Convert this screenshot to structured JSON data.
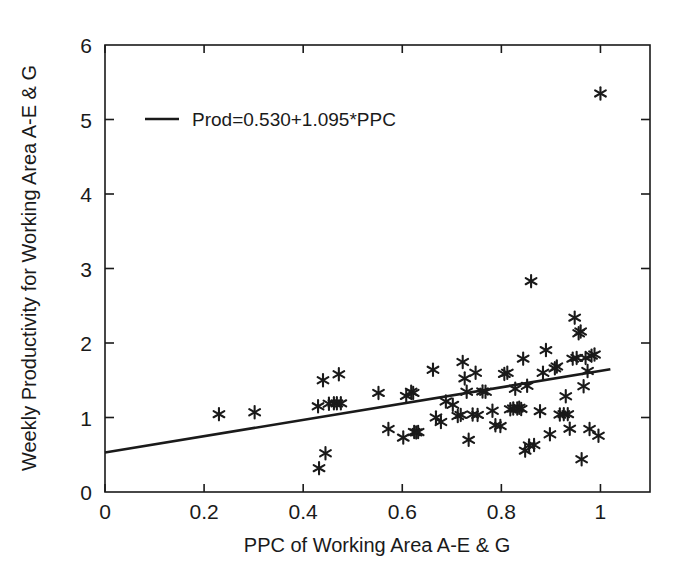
{
  "chart_data": {
    "type": "scatter",
    "title": "",
    "xlabel": "PPC of  Working Area A-E & G",
    "ylabel": "Weekly Productivity for Working Area A-E & G",
    "xlim": [
      0,
      1.1
    ],
    "ylim": [
      0,
      6
    ],
    "xticks": [
      0,
      0.2,
      0.4,
      0.6,
      0.8,
      1
    ],
    "xticklabels": [
      "0",
      "0.2",
      "0.4",
      "0.6",
      "0.8",
      "1"
    ],
    "yticks": [
      0,
      1,
      2,
      3,
      4,
      5,
      6
    ],
    "yticklabels": [
      "0",
      "1",
      "2",
      "3",
      "4",
      "5",
      "6"
    ],
    "grid": false,
    "marker": "asterisk-star",
    "marker_color": "#1a1a1a",
    "legend": {
      "position": "upper-left-inside",
      "entries": [
        {
          "label": "Prod=0.530+1.095*PPC",
          "style": "line"
        }
      ]
    },
    "fit": {
      "label": "Prod=0.530+1.095*PPC",
      "intercept": 0.53,
      "slope": 1.095,
      "x_start": 0.0,
      "x_end": 1.02,
      "y_start": 0.53,
      "y_end": 1.647
    },
    "series": [
      {
        "name": "Observations",
        "points": [
          [
            0.23,
            1.045
          ],
          [
            0.302,
            1.07
          ],
          [
            0.43,
            1.15
          ],
          [
            0.432,
            0.32
          ],
          [
            0.44,
            1.5
          ],
          [
            0.445,
            0.52
          ],
          [
            0.452,
            1.185
          ],
          [
            0.462,
            1.19
          ],
          [
            0.468,
            1.19
          ],
          [
            0.472,
            1.58
          ],
          [
            0.476,
            1.19
          ],
          [
            0.552,
            1.33
          ],
          [
            0.572,
            0.845
          ],
          [
            0.602,
            0.73
          ],
          [
            0.608,
            1.29
          ],
          [
            0.618,
            1.345
          ],
          [
            0.622,
            1.33
          ],
          [
            0.624,
            0.805
          ],
          [
            0.628,
            0.8
          ],
          [
            0.632,
            0.805
          ],
          [
            0.662,
            1.64
          ],
          [
            0.668,
            1.0
          ],
          [
            0.678,
            0.94
          ],
          [
            0.688,
            1.215
          ],
          [
            0.702,
            1.17
          ],
          [
            0.712,
            1.02
          ],
          [
            0.718,
            1.035
          ],
          [
            0.722,
            1.745
          ],
          [
            0.726,
            1.525
          ],
          [
            0.73,
            1.345
          ],
          [
            0.734,
            0.7
          ],
          [
            0.742,
            1.04
          ],
          [
            0.748,
            1.6
          ],
          [
            0.752,
            1.035
          ],
          [
            0.762,
            1.35
          ],
          [
            0.768,
            1.345
          ],
          [
            0.782,
            1.09
          ],
          [
            0.788,
            0.895
          ],
          [
            0.798,
            0.885
          ],
          [
            0.806,
            1.585
          ],
          [
            0.812,
            1.6
          ],
          [
            0.818,
            1.11
          ],
          [
            0.824,
            1.12
          ],
          [
            0.828,
            1.385
          ],
          [
            0.832,
            1.12
          ],
          [
            0.836,
            1.13
          ],
          [
            0.84,
            1.115
          ],
          [
            0.844,
            1.79
          ],
          [
            0.848,
            0.555
          ],
          [
            0.852,
            1.425
          ],
          [
            0.856,
            0.625
          ],
          [
            0.86,
            2.83
          ],
          [
            0.866,
            0.63
          ],
          [
            0.878,
            1.085
          ],
          [
            0.884,
            1.6
          ],
          [
            0.89,
            1.905
          ],
          [
            0.898,
            0.775
          ],
          [
            0.908,
            1.66
          ],
          [
            0.912,
            1.685
          ],
          [
            0.918,
            1.04
          ],
          [
            0.926,
            1.045
          ],
          [
            0.93,
            1.285
          ],
          [
            0.934,
            1.045
          ],
          [
            0.938,
            0.85
          ],
          [
            0.944,
            1.79
          ],
          [
            0.948,
            2.34
          ],
          [
            0.952,
            1.8
          ],
          [
            0.956,
            2.13
          ],
          [
            0.96,
            2.155
          ],
          [
            0.962,
            0.44
          ],
          [
            0.966,
            1.42
          ],
          [
            0.97,
            1.8
          ],
          [
            0.974,
            1.625
          ],
          [
            0.978,
            0.845
          ],
          [
            0.982,
            1.83
          ],
          [
            0.988,
            1.845
          ],
          [
            0.996,
            0.755
          ],
          [
            1.0,
            5.35
          ]
        ]
      }
    ]
  },
  "figure": {
    "background": "#ffffff",
    "foreground": "#1a1a1a"
  }
}
